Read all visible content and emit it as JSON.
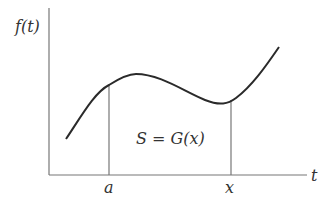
{
  "diagram": {
    "y_axis_label": "f(t)",
    "x_axis_label": "t",
    "lower_limit_label": "a",
    "upper_limit_label": "x",
    "area_label": "S = G(x)",
    "colors": {
      "axes": "#777777",
      "curve": "#2a2a2a",
      "text": "#333333"
    }
  }
}
